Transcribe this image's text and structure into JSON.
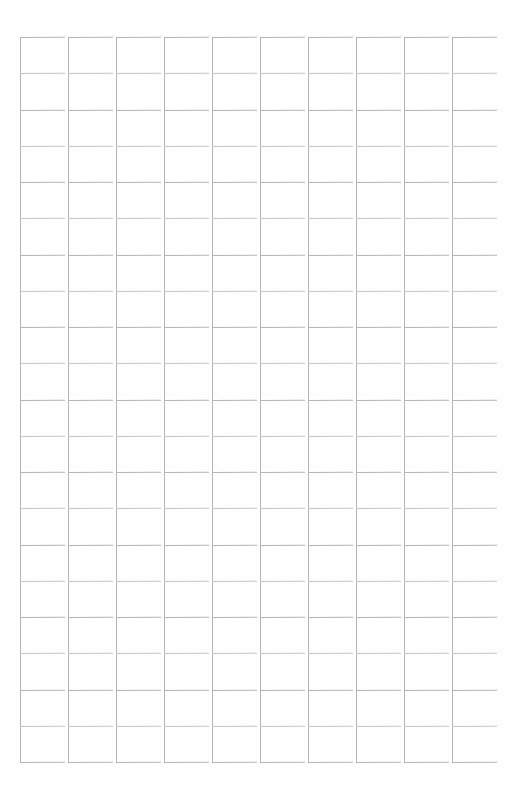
{
  "document": {
    "title": "Blank Grid Form",
    "kind": "blank-ruled-grid-sheet",
    "description": "Scanned blank grid / tally sheet with empty rectangular cells",
    "background_color": "#fefefe",
    "line_color": "#b4b4b4",
    "line_color_light": "#c6c6c6",
    "page_width": 518,
    "page_height": 805
  },
  "grid": {
    "columns": 10,
    "rows": 20,
    "column_pitch": 48,
    "column_start_x": 20,
    "cell_width": 43,
    "row_pitch": 36.25,
    "grid_top_y": 37,
    "grid_bottom_y": 762,
    "column_x_positions": [
      20,
      68,
      116,
      164,
      212,
      260,
      308,
      356,
      404,
      452
    ],
    "row_y_positions": [
      37.0,
      73.25,
      109.5,
      145.75,
      182.0,
      218.25,
      254.5,
      290.75,
      327.0,
      363.25,
      399.5,
      435.75,
      472.0,
      508.25,
      544.5,
      580.75,
      617.0,
      653.25,
      689.5,
      725.75,
      762.0
    ],
    "column_labels": [
      "column-1",
      "column-2",
      "column-3",
      "column-4",
      "column-5",
      "column-6",
      "column-7",
      "column-8",
      "column-9",
      "column-10"
    ],
    "cell_values": [
      [
        "",
        "",
        "",
        "",
        "",
        "",
        "",
        "",
        "",
        "",
        "",
        "",
        "",
        "",
        "",
        "",
        "",
        "",
        "",
        ""
      ],
      [
        "",
        "",
        "",
        "",
        "",
        "",
        "",
        "",
        "",
        "",
        "",
        "",
        "",
        "",
        "",
        "",
        "",
        "",
        "",
        ""
      ],
      [
        "",
        "",
        "",
        "",
        "",
        "",
        "",
        "",
        "",
        "",
        "",
        "",
        "",
        "",
        "",
        "",
        "",
        "",
        "",
        ""
      ],
      [
        "",
        "",
        "",
        "",
        "",
        "",
        "",
        "",
        "",
        "",
        "",
        "",
        "",
        "",
        "",
        "",
        "",
        "",
        "",
        ""
      ],
      [
        "",
        "",
        "",
        "",
        "",
        "",
        "",
        "",
        "",
        "",
        "",
        "",
        "",
        "",
        "",
        "",
        "",
        "",
        "",
        ""
      ],
      [
        "",
        "",
        "",
        "",
        "",
        "",
        "",
        "",
        "",
        "",
        "",
        "",
        "",
        "",
        "",
        "",
        "",
        "",
        "",
        ""
      ],
      [
        "",
        "",
        "",
        "",
        "",
        "",
        "",
        "",
        "",
        "",
        "",
        "",
        "",
        "",
        "",
        "",
        "",
        "",
        "",
        ""
      ],
      [
        "",
        "",
        "",
        "",
        "",
        "",
        "",
        "",
        "",
        "",
        "",
        "",
        "",
        "",
        "",
        "",
        "",
        "",
        "",
        ""
      ],
      [
        "",
        "",
        "",
        "",
        "",
        "",
        "",
        "",
        "",
        "",
        "",
        "",
        "",
        "",
        "",
        "",
        "",
        "",
        "",
        ""
      ],
      [
        "",
        "",
        "",
        "",
        "",
        "",
        "",
        "",
        "",
        "",
        "",
        "",
        "",
        "",
        "",
        "",
        "",
        "",
        "",
        ""
      ]
    ]
  },
  "scan": {
    "hrule_slant_degrees": -0.35,
    "hrule_overhang": 2
  }
}
